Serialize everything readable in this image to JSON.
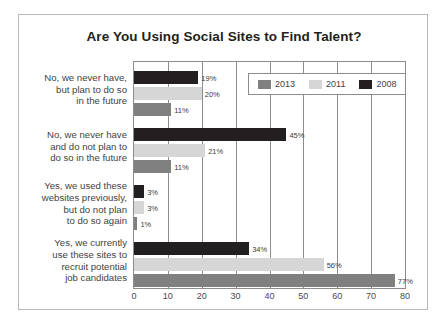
{
  "chart_data": {
    "type": "bar",
    "orientation": "horizontal",
    "title": "Are You Using Social Sites to Find Talent?",
    "xlabel": "",
    "ylabel": "",
    "xlim": [
      0,
      80
    ],
    "xticks": [
      0,
      10,
      20,
      30,
      40,
      50,
      60,
      70,
      80
    ],
    "grid": true,
    "legend_position": "top-right",
    "categories": [
      "No, we never have, but plan to do so in the future",
      "No, we never have and do not plan to do so in the future",
      "Yes, we used these websites previously, but do not plan to do so again",
      "Yes, we currently use these sites to recruit potential job candidates"
    ],
    "category_lines": [
      [
        "No, we never have,",
        "but plan to do so",
        "in the future"
      ],
      [
        "No, we never have",
        "and do not plan to",
        "do so in the future"
      ],
      [
        "Yes, we used these",
        "websites previously,",
        "but do not plan",
        "to do so again"
      ],
      [
        "Yes, we currently",
        "use these sites to",
        "recruit potential",
        "job candidates"
      ]
    ],
    "series": [
      {
        "name": "2008",
        "color": "#231f20",
        "values": [
          19,
          45,
          3,
          34
        ],
        "labels": [
          "19%",
          "45%",
          "3%",
          "34%"
        ]
      },
      {
        "name": "2011",
        "color": "#d6d6d6",
        "values": [
          20,
          21,
          3,
          56
        ],
        "labels": [
          "20%",
          "21%",
          "3%",
          "56%"
        ]
      },
      {
        "name": "2013",
        "color": "#808080",
        "values": [
          11,
          11,
          1,
          77
        ],
        "labels": [
          "11%",
          "11%",
          "1%",
          "77%"
        ]
      }
    ],
    "legend": [
      {
        "name": "2013",
        "color": "#808080"
      },
      {
        "name": "2011",
        "color": "#d6d6d6"
      },
      {
        "name": "2008",
        "color": "#231f20"
      }
    ],
    "tick_labels": [
      "0",
      "10",
      "20",
      "30",
      "40",
      "50",
      "60",
      "70",
      "80"
    ]
  }
}
